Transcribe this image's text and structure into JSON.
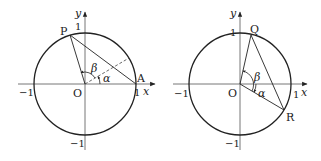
{
  "figures": [
    {
      "id": "left",
      "axes": {
        "x_label": "x",
        "y_label": "y"
      },
      "ticks": {
        "x_pos": "1",
        "x_neg": "−1",
        "y_pos": "1",
        "y_neg": "−1"
      },
      "points": {
        "origin": "O",
        "p1": "P",
        "p2": "A"
      },
      "angles": {
        "alpha": "α",
        "beta": "β"
      },
      "elements": [
        "unit circle",
        "segment OP",
        "segment PA",
        "dashed ray at angle α",
        "angle arcs α and β"
      ]
    },
    {
      "id": "right",
      "axes": {
        "x_label": "x",
        "y_label": "y"
      },
      "ticks": {
        "x_pos": "1",
        "x_neg": "−1",
        "y_pos": "1",
        "y_neg": "−1"
      },
      "points": {
        "origin": "O",
        "p1": "Q",
        "p2": "R"
      },
      "angles": {
        "alpha": "α",
        "beta": "β"
      },
      "elements": [
        "unit circle",
        "segment OQ",
        "segment OR",
        "segment QR",
        "angle arcs α and β"
      ]
    }
  ],
  "colors": {
    "stroke": "#222222",
    "axis": "#555555",
    "background": "#ffffff"
  }
}
